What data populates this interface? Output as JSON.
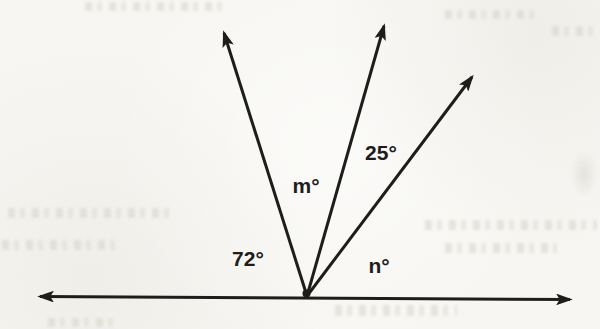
{
  "figure": {
    "labels": {
      "left_angle": "72°",
      "middle_angle": "m°",
      "upper_right_angle": "25°",
      "right_angle": "n°"
    },
    "known_angle_values_deg": {
      "left_angle": 72,
      "upper_right_angle": 25
    },
    "unknown_angle_variables": [
      "m",
      "n"
    ],
    "colors": {
      "ink": "#1e1d1b",
      "paper": "#f7f6f2"
    }
  }
}
